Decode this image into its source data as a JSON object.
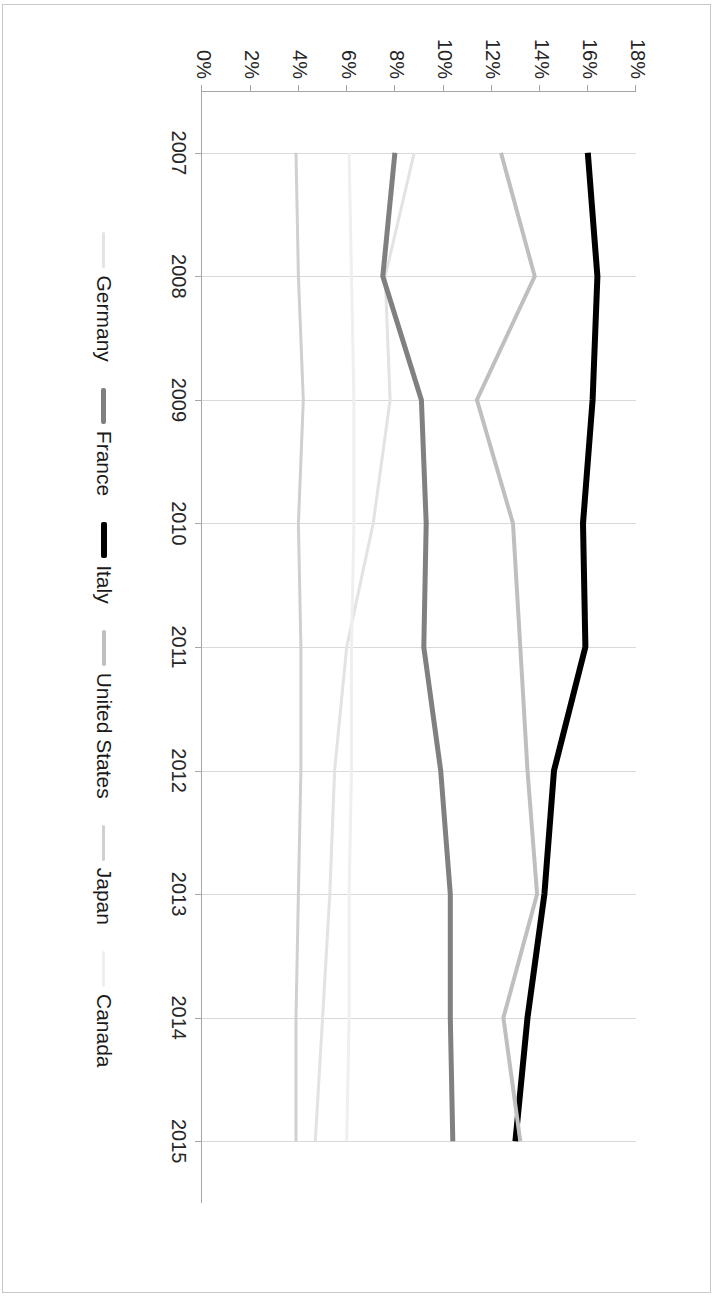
{
  "chart_data": {
    "type": "line",
    "title": "",
    "xlabel": "",
    "ylabel": "",
    "x": [
      2007,
      2008,
      2009,
      2010,
      2011,
      2012,
      2013,
      2014,
      2015
    ],
    "xtick_labels": [
      "2007",
      "2008",
      "2009",
      "2010",
      "2011",
      "2012",
      "2013",
      "2014",
      "2015"
    ],
    "ytick_labels": [
      "0%",
      "2%",
      "4%",
      "6%",
      "8%",
      "10%",
      "12%",
      "14%",
      "16%",
      "18%"
    ],
    "ytick_values": [
      0,
      2,
      4,
      6,
      8,
      10,
      12,
      14,
      16,
      18
    ],
    "ylim": [
      0,
      18
    ],
    "yunit": "%",
    "grid": "x-gridlines-only",
    "legend_position": "bottom",
    "orientation": "rotated-90",
    "series": [
      {
        "name": "Germany",
        "color": "#e3e3e3",
        "width": 3,
        "values": [
          8.8,
          7.6,
          7.8,
          7.1,
          6.0,
          5.5,
          5.3,
          5.0,
          4.7
        ]
      },
      {
        "name": "France",
        "color": "#808080",
        "width": 5,
        "values": [
          8.0,
          7.5,
          9.1,
          9.3,
          9.2,
          9.9,
          10.3,
          10.3,
          10.4
        ]
      },
      {
        "name": "Italy",
        "color": "#000000",
        "width": 6,
        "values": [
          16.0,
          16.4,
          16.2,
          15.8,
          15.9,
          14.6,
          14.2,
          13.5,
          13.0
        ]
      },
      {
        "name": "United States",
        "color": "#bfbfbf",
        "width": 4,
        "values": [
          12.4,
          13.8,
          11.4,
          12.9,
          13.2,
          13.5,
          13.9,
          12.5,
          13.2
        ]
      },
      {
        "name": "Japan",
        "color": "#d0d0d0",
        "width": 3,
        "values": [
          3.9,
          4.0,
          4.2,
          4.0,
          4.1,
          4.1,
          4.0,
          3.9,
          3.9
        ]
      },
      {
        "name": "Canada",
        "color": "#efefef",
        "width": 3,
        "values": [
          6.1,
          6.2,
          6.3,
          6.3,
          6.2,
          6.2,
          6.1,
          6.1,
          6.0
        ]
      }
    ]
  },
  "legend": {
    "items": [
      {
        "label": "Germany",
        "color": "#e3e3e3"
      },
      {
        "label": "France",
        "color": "#808080"
      },
      {
        "label": "Italy",
        "color": "#000000"
      },
      {
        "label": "United States",
        "color": "#bfbfbf"
      },
      {
        "label": "Japan",
        "color": "#d0d0d0"
      },
      {
        "label": "Canada",
        "color": "#efefef"
      }
    ]
  }
}
